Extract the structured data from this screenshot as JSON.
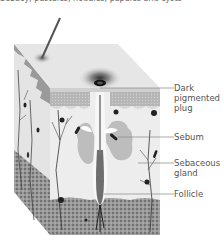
{
  "caption_cut_off": "Sebacy, pustules, nodules, papules and cysts",
  "diagram": {
    "labels": [
      {
        "id": "dark-pigmented-plug",
        "lines": [
          "Dark",
          "pigmented",
          "plug"
        ]
      },
      {
        "id": "sebum",
        "lines": [
          "Sebum"
        ]
      },
      {
        "id": "sebaceous-gland",
        "lines": [
          "Sebaceous",
          "gland"
        ]
      },
      {
        "id": "follicle",
        "lines": [
          "Follicle"
        ]
      }
    ]
  }
}
